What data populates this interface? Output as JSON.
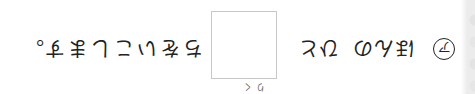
{
  "orientation": "rotated-180",
  "exercise": {
    "marker": "ア",
    "segments": [
      "ほんの",
      "ひと",
      "ちをいこします。"
    ],
    "answer_box": {
      "value": "",
      "furigana": "りく"
    }
  },
  "colors": {
    "text": "#222222",
    "box_border": "#c8c8c8",
    "edge": "#e6e6e6",
    "background": "#ffffff"
  }
}
